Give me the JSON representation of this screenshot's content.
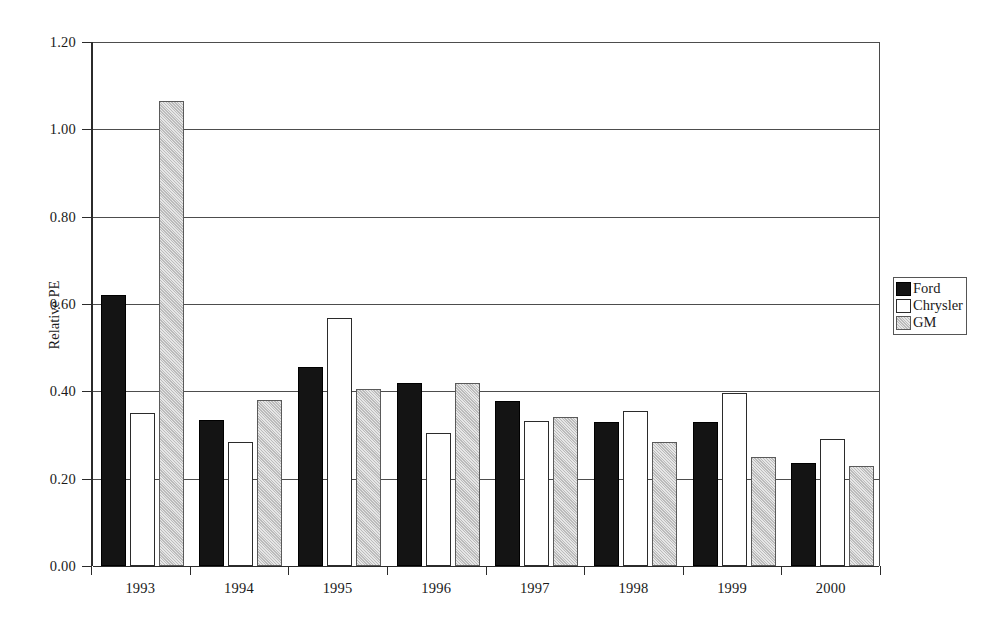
{
  "chart_data": {
    "type": "bar",
    "title": "",
    "subtitle": "",
    "xlabel": "",
    "ylabel": "Relative PE",
    "categories": [
      "1993",
      "1994",
      "1995",
      "1996",
      "1997",
      "1998",
      "1999",
      "2000"
    ],
    "series": [
      {
        "name": "Ford",
        "color": "#141414",
        "values": [
          0.62,
          0.335,
          0.455,
          0.42,
          0.378,
          0.33,
          0.33,
          0.237
        ]
      },
      {
        "name": "Chrysler",
        "color": "#ffffff",
        "values": [
          0.35,
          0.285,
          0.568,
          0.305,
          0.333,
          0.355,
          0.397,
          0.29
        ]
      },
      {
        "name": "GM",
        "color": "#c8c8c8",
        "values": [
          1.065,
          0.38,
          0.405,
          0.418,
          0.341,
          0.283,
          0.25,
          0.23
        ]
      }
    ],
    "ylim": [
      0.0,
      1.2
    ],
    "ytick_values": [
      0.0,
      0.2,
      0.4,
      0.6,
      0.8,
      1.0,
      1.2
    ],
    "ytick_labels": [
      "0.00",
      "0.20",
      "0.40",
      "0.60",
      "0.80",
      "1.00",
      "1.20"
    ],
    "grid": true,
    "grid_axis": "y",
    "legend_position": "right",
    "legend_entries": [
      "Ford",
      "Chrysler",
      "GM"
    ]
  }
}
